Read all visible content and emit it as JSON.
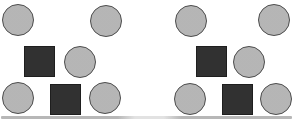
{
  "figure": {
    "background": "#ffffff",
    "shape_colors": {
      "circle_fill": "#b9b9b9",
      "circle_border": "#4d4d4d",
      "square_fill": "#2e2e2e",
      "square_border": "#1e1e1e"
    },
    "bottom_edge": {
      "y": 116,
      "height": 3,
      "color": "#b7b7b7",
      "gap_color": "#e2e2e2"
    },
    "panels": [
      {
        "name": "left-panel",
        "shapes": [
          {
            "type": "circle",
            "cx": 18,
            "cy": 20,
            "r": 16
          },
          {
            "type": "circle",
            "cx": 106,
            "cy": 21,
            "r": 16
          },
          {
            "type": "square",
            "x": 24,
            "y": 46,
            "w": 31,
            "h": 31
          },
          {
            "type": "circle",
            "cx": 80,
            "cy": 62,
            "r": 16
          },
          {
            "type": "circle",
            "cx": 18,
            "cy": 98,
            "r": 16
          },
          {
            "type": "square",
            "x": 50,
            "y": 84,
            "w": 31,
            "h": 31
          },
          {
            "type": "circle",
            "cx": 105,
            "cy": 98,
            "r": 16
          }
        ]
      },
      {
        "name": "right-panel",
        "shapes": [
          {
            "type": "circle",
            "cx": 191,
            "cy": 21,
            "r": 16
          },
          {
            "type": "circle",
            "cx": 274,
            "cy": 20,
            "r": 16
          },
          {
            "type": "square",
            "x": 196,
            "y": 46,
            "w": 31,
            "h": 31
          },
          {
            "type": "circle",
            "cx": 249,
            "cy": 62,
            "r": 16
          },
          {
            "type": "circle",
            "cx": 190,
            "cy": 99,
            "r": 16
          },
          {
            "type": "square",
            "x": 222,
            "y": 84,
            "w": 31,
            "h": 31
          },
          {
            "type": "circle",
            "cx": 276,
            "cy": 99,
            "r": 16
          }
        ]
      }
    ]
  }
}
